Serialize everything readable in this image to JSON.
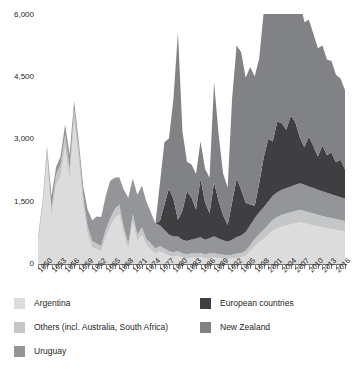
{
  "chart_data": {
    "type": "area",
    "stacked": true,
    "title": "",
    "subtitle": "",
    "xlabel": "",
    "ylabel": "",
    "grid": true,
    "legend_position": "bottom",
    "ylim": [
      0,
      6000
    ],
    "yticks": [
      0,
      1500,
      3000,
      4500,
      6000
    ],
    "ytick_labels": [
      "0",
      "1,500",
      "3,000",
      "4,500",
      "6,000"
    ],
    "xlim": [
      1950,
      2018
    ],
    "xtick_labels": [
      "1950",
      "1953",
      "1956",
      "1959",
      "1962",
      "1965",
      "1968",
      "1971",
      "1974",
      "1977",
      "1980",
      "1983",
      "1986",
      "1989",
      "1992",
      "1995",
      "1998",
      "2001",
      "2004",
      "2007",
      "2010",
      "2013",
      "2016"
    ],
    "x": [
      1950,
      1951,
      1952,
      1953,
      1954,
      1955,
      1956,
      1957,
      1958,
      1959,
      1960,
      1961,
      1962,
      1963,
      1964,
      1965,
      1966,
      1967,
      1968,
      1969,
      1970,
      1971,
      1972,
      1973,
      1974,
      1975,
      1976,
      1977,
      1978,
      1979,
      1980,
      1981,
      1982,
      1983,
      1984,
      1985,
      1986,
      1987,
      1988,
      1989,
      1990,
      1991,
      1992,
      1993,
      1994,
      1995,
      1996,
      1997,
      1998,
      1999,
      2000,
      2001,
      2002,
      2003,
      2004,
      2005,
      2006,
      2007,
      2008,
      2009,
      2010,
      2011,
      2012,
      2013,
      2014,
      2015,
      2016,
      2017,
      2018
    ],
    "series": [
      {
        "name": "Argentina",
        "color": "#dcdcdc",
        "values": [
          500,
          1250,
          2500,
          1150,
          1900,
          2100,
          2800,
          2000,
          3400,
          2500,
          1400,
          700,
          400,
          350,
          300,
          650,
          900,
          1100,
          1200,
          700,
          350,
          1000,
          550,
          700,
          450,
          350,
          250,
          300,
          250,
          200,
          180,
          200,
          150,
          140,
          150,
          150,
          160,
          140,
          150,
          160,
          140,
          130,
          120,
          130,
          150,
          160,
          200,
          300,
          420,
          520,
          600,
          700,
          800,
          860,
          900,
          930,
          950,
          980,
          1000,
          980,
          950,
          930,
          900,
          880,
          860,
          840,
          820,
          800,
          780
        ]
      },
      {
        "name": "Others (incl. Australia, South Africa)",
        "color": "#c4c6c8",
        "values": [
          100,
          150,
          200,
          180,
          250,
          280,
          300,
          280,
          320,
          300,
          250,
          200,
          150,
          140,
          130,
          180,
          200,
          220,
          230,
          180,
          140,
          200,
          160,
          180,
          150,
          140,
          120,
          130,
          120,
          110,
          100,
          110,
          100,
          95,
          100,
          100,
          105,
          95,
          100,
          105,
          95,
          90,
          85,
          90,
          100,
          105,
          120,
          150,
          180,
          200,
          220,
          240,
          260,
          270,
          280,
          285,
          290,
          295,
          300,
          295,
          290,
          285,
          280,
          275,
          270,
          265,
          260,
          255,
          250
        ]
      },
      {
        "name": "Uruguay",
        "color": "#939598",
        "values": [
          50,
          80,
          120,
          300,
          180,
          200,
          250,
          350,
          200,
          180,
          220,
          400,
          500,
          650,
          700,
          800,
          900,
          750,
          650,
          900,
          1100,
          850,
          950,
          1000,
          900,
          750,
          600,
          500,
          450,
          400,
          380,
          350,
          330,
          320,
          340,
          360,
          380,
          350,
          370,
          400,
          380,
          350,
          330,
          360,
          400,
          420,
          450,
          480,
          500,
          520,
          540,
          560,
          580,
          590,
          600,
          610,
          620,
          630,
          640,
          630,
          620,
          610,
          600,
          590,
          580,
          570,
          560,
          550,
          540
        ]
      },
      {
        "name": "European countries",
        "color": "#3f3f41",
        "values": [
          0,
          0,
          0,
          0,
          0,
          0,
          0,
          0,
          0,
          0,
          0,
          0,
          0,
          0,
          0,
          0,
          0,
          0,
          0,
          0,
          0,
          0,
          0,
          0,
          0,
          0,
          0,
          100,
          600,
          1100,
          900,
          400,
          700,
          1200,
          1000,
          700,
          1400,
          900,
          600,
          1300,
          900,
          600,
          400,
          900,
          1400,
          1100,
          700,
          500,
          300,
          700,
          1200,
          1500,
          1300,
          1700,
          1600,
          1400,
          1700,
          1500,
          1100,
          900,
          1200,
          1000,
          800,
          1100,
          900,
          1000,
          800,
          900,
          700
        ]
      },
      {
        "name": "New Zealand",
        "color": "#808285",
        "values": [
          0,
          0,
          0,
          0,
          0,
          0,
          0,
          0,
          0,
          0,
          0,
          0,
          0,
          0,
          0,
          0,
          0,
          0,
          0,
          0,
          0,
          0,
          0,
          0,
          0,
          0,
          0,
          900,
          1500,
          1200,
          2400,
          4500,
          1900,
          700,
          800,
          850,
          900,
          800,
          850,
          2400,
          1600,
          1000,
          900,
          2500,
          3200,
          3300,
          3000,
          3300,
          3100,
          3000,
          3500,
          3400,
          3300,
          3200,
          3400,
          3300,
          3000,
          3100,
          3300,
          3000,
          2800,
          2700,
          2600,
          2400,
          2300,
          2200,
          2100,
          1950,
          1900
        ]
      }
    ],
    "peaks": [
      {
        "year": 1958,
        "value": 4200,
        "label": "Argentina peak"
      },
      {
        "year": 1981,
        "value": 5600,
        "label": "New Zealand spike"
      },
      {
        "year": 2006,
        "value": 5300,
        "label": "late peak"
      }
    ]
  },
  "legend": {
    "items": [
      {
        "label": "Argentina",
        "color": "#dcdcdc"
      },
      {
        "label": "Others (incl. Australia, South Africa)",
        "color": "#c4c6c8"
      },
      {
        "label": "Uruguay",
        "color": "#939598"
      },
      {
        "label": "European countries",
        "color": "#3f3f41"
      },
      {
        "label": "New Zealand",
        "color": "#808285"
      }
    ]
  }
}
